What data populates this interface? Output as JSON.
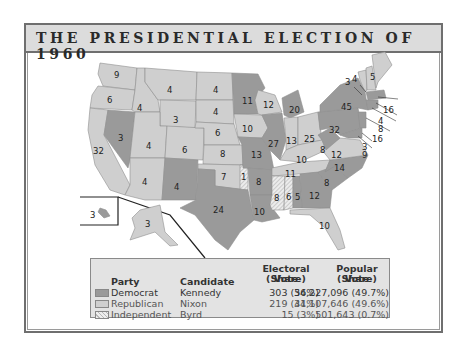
{
  "title": "THE PRESIDENTIAL ELECTION OF 1960",
  "colors": {
    "democrat": "#9a9a9a",
    "republican": "#cfcfcf",
    "independent": "hatched",
    "frame": "#6f6f6f",
    "title_bg": "#dcdcdc",
    "legend_bg": "#e3e3e3"
  },
  "legend": {
    "headers": {
      "party": "Party",
      "candidate": "Candidate",
      "electoral_line1": "Electoral Vote",
      "electoral_line2": "(Share)",
      "popular_line1": "Popular Vote",
      "popular_line2": "(Share)"
    },
    "rows": [
      {
        "party": "Democrat",
        "candidate": "Kennedy",
        "electoral": "303 (56%)",
        "popular": "34,227,096 (49.7%)"
      },
      {
        "party": "Republican",
        "candidate": "Nixon",
        "electoral": "219 (41%)",
        "popular": "34,107,646 (49.6%)"
      },
      {
        "party": "Independent",
        "candidate": "Byrd",
        "electoral": "15 (3%)",
        "popular": "501,643 (0.7%)"
      }
    ]
  },
  "states": [
    {
      "name": "Washington",
      "ev": "9",
      "party": "R"
    },
    {
      "name": "Oregon",
      "ev": "6",
      "party": "R"
    },
    {
      "name": "California",
      "ev": "32",
      "party": "R"
    },
    {
      "name": "Nevada",
      "ev": "3",
      "party": "D"
    },
    {
      "name": "Idaho",
      "ev": "4",
      "party": "R"
    },
    {
      "name": "Montana",
      "ev": "4",
      "party": "R"
    },
    {
      "name": "Wyoming",
      "ev": "3",
      "party": "R"
    },
    {
      "name": "Utah",
      "ev": "4",
      "party": "R"
    },
    {
      "name": "Arizona",
      "ev": "4",
      "party": "R"
    },
    {
      "name": "Colorado",
      "ev": "6",
      "party": "R"
    },
    {
      "name": "New Mexico",
      "ev": "4",
      "party": "D"
    },
    {
      "name": "North Dakota",
      "ev": "4",
      "party": "R"
    },
    {
      "name": "South Dakota",
      "ev": "4",
      "party": "R"
    },
    {
      "name": "Nebraska",
      "ev": "6",
      "party": "R"
    },
    {
      "name": "Kansas",
      "ev": "8",
      "party": "R"
    },
    {
      "name": "Oklahoma",
      "ev": "7",
      "party": "R"
    },
    {
      "name": "Oklahoma (Byrd)",
      "ev": "1",
      "party": "I"
    },
    {
      "name": "Texas",
      "ev": "24",
      "party": "D"
    },
    {
      "name": "Minnesota",
      "ev": "11",
      "party": "D"
    },
    {
      "name": "Iowa",
      "ev": "10",
      "party": "R"
    },
    {
      "name": "Missouri",
      "ev": "13",
      "party": "D"
    },
    {
      "name": "Arkansas",
      "ev": "8",
      "party": "D"
    },
    {
      "name": "Louisiana",
      "ev": "10",
      "party": "D"
    },
    {
      "name": "Wisconsin",
      "ev": "12",
      "party": "R"
    },
    {
      "name": "Illinois",
      "ev": "27",
      "party": "D"
    },
    {
      "name": "Michigan",
      "ev": "20",
      "party": "D"
    },
    {
      "name": "Indiana",
      "ev": "13",
      "party": "R"
    },
    {
      "name": "Ohio",
      "ev": "25",
      "party": "R"
    },
    {
      "name": "Kentucky",
      "ev": "10",
      "party": "R"
    },
    {
      "name": "Tennessee",
      "ev": "11",
      "party": "R"
    },
    {
      "name": "Mississippi",
      "ev": "8",
      "party": "I"
    },
    {
      "name": "Alabama (Byrd)",
      "ev": "6",
      "party": "I"
    },
    {
      "name": "Alabama",
      "ev": "5",
      "party": "D"
    },
    {
      "name": "Georgia",
      "ev": "12",
      "party": "D"
    },
    {
      "name": "Florida",
      "ev": "10",
      "party": "R"
    },
    {
      "name": "South Carolina",
      "ev": "8",
      "party": "D"
    },
    {
      "name": "North Carolina",
      "ev": "14",
      "party": "D"
    },
    {
      "name": "Virginia",
      "ev": "12",
      "party": "R"
    },
    {
      "name": "West Virginia",
      "ev": "8",
      "party": "D"
    },
    {
      "name": "Pennsylvania",
      "ev": "32",
      "party": "D"
    },
    {
      "name": "New York",
      "ev": "45",
      "party": "D"
    },
    {
      "name": "Vermont",
      "ev": "3",
      "party": "R"
    },
    {
      "name": "New Hampshire",
      "ev": "4",
      "party": "R"
    },
    {
      "name": "Maine",
      "ev": "5",
      "party": "R"
    },
    {
      "name": "Massachusetts",
      "ev": "16",
      "party": "D"
    },
    {
      "name": "Rhode Island",
      "ev": "4",
      "party": "D"
    },
    {
      "name": "Connecticut",
      "ev": "8",
      "party": "D"
    },
    {
      "name": "New Jersey",
      "ev": "16",
      "party": "D"
    },
    {
      "name": "Delaware",
      "ev": "3",
      "party": "D"
    },
    {
      "name": "Maryland",
      "ev": "9",
      "party": "D"
    },
    {
      "name": "Hawaii",
      "ev": "3",
      "party": "D"
    },
    {
      "name": "Alaska",
      "ev": "3",
      "party": "R"
    }
  ]
}
